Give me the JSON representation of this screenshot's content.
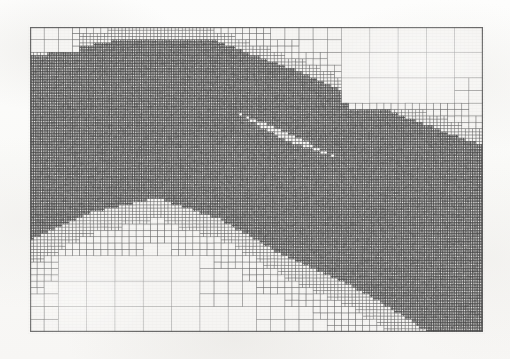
{
  "figure": {
    "kind": "adaptive-mesh-refinement-grid",
    "caption": "",
    "title": "",
    "axis_labels": [],
    "tick_labels": [],
    "legend": [],
    "annotations": []
  },
  "page": {
    "width": 510,
    "height": 359,
    "background_color": "#fbfbfa",
    "scan_artifact_text": "",
    "has_visible_text": false
  },
  "colors": {
    "page_background": "#fbfbfa",
    "mesh_background": "#f6f5f3",
    "grid_line": "#6e6e6e",
    "grid_line_dark": "#4a4a4a",
    "grid_line_light": "#9a9a9a",
    "border": "#5a5a5a"
  },
  "mesh": {
    "origin_x": 30,
    "origin_y": 27,
    "width": 453,
    "height": 305,
    "border_width": 1.2,
    "base_cols": 8,
    "base_rows": 6,
    "max_depth": 6,
    "min_cell_px": 1.9,
    "line_width": 0.55,
    "refinement_scheme": "quadtree-bisection",
    "refinement_label": "diagonal-band"
  },
  "chart_data": {
    "type": "mesh",
    "title": "",
    "xlabel": "",
    "ylabel": "",
    "xlim": [
      0,
      1
    ],
    "ylim": [
      0,
      1
    ],
    "grid": true,
    "legend_position": "none",
    "refinement_levels": [
      0,
      1,
      2,
      3,
      4,
      5,
      6
    ],
    "level_cell_sizes_px": [
      56.6,
      28.3,
      14.2,
      7.1,
      3.5,
      2.4,
      1.9
    ],
    "refinement_band": {
      "shape": "diagonal-strip",
      "start_normalized": [
        0.02,
        0.47
      ],
      "end_normalized": [
        1.0,
        0.86
      ],
      "control_points_normalized": [
        [
          0.0,
          0.46
        ],
        [
          0.13,
          0.4
        ],
        [
          0.28,
          0.36
        ],
        [
          0.42,
          0.44
        ],
        [
          0.56,
          0.56
        ],
        [
          0.7,
          0.64
        ],
        [
          0.84,
          0.74
        ],
        [
          1.0,
          0.88
        ]
      ],
      "half_width_normalized": [
        0.24,
        0.21,
        0.2,
        0.19,
        0.19,
        0.2,
        0.22,
        0.25
      ]
    },
    "secondary_band": {
      "shape": "diagonal-strip",
      "control_points_normalized": [
        [
          0.0,
          0.22
        ],
        [
          0.2,
          0.14
        ],
        [
          0.4,
          0.14
        ],
        [
          0.6,
          0.26
        ],
        [
          0.8,
          0.4
        ],
        [
          1.0,
          0.52
        ]
      ],
      "half_width_normalized": [
        0.12,
        0.1,
        0.1,
        0.11,
        0.12,
        0.13
      ]
    },
    "coarse_regions": [
      {
        "name": "upper-right-corner",
        "x": 0.66,
        "y": 0.0,
        "w": 0.34,
        "h": 0.3,
        "level": 0
      },
      {
        "name": "lower-left-corner",
        "x": 0.0,
        "y": 0.74,
        "w": 0.42,
        "h": 0.26,
        "level": 0
      },
      {
        "name": "upper-left-corner",
        "x": 0.0,
        "y": 0.0,
        "w": 0.12,
        "h": 0.1,
        "level": 1
      }
    ]
  }
}
